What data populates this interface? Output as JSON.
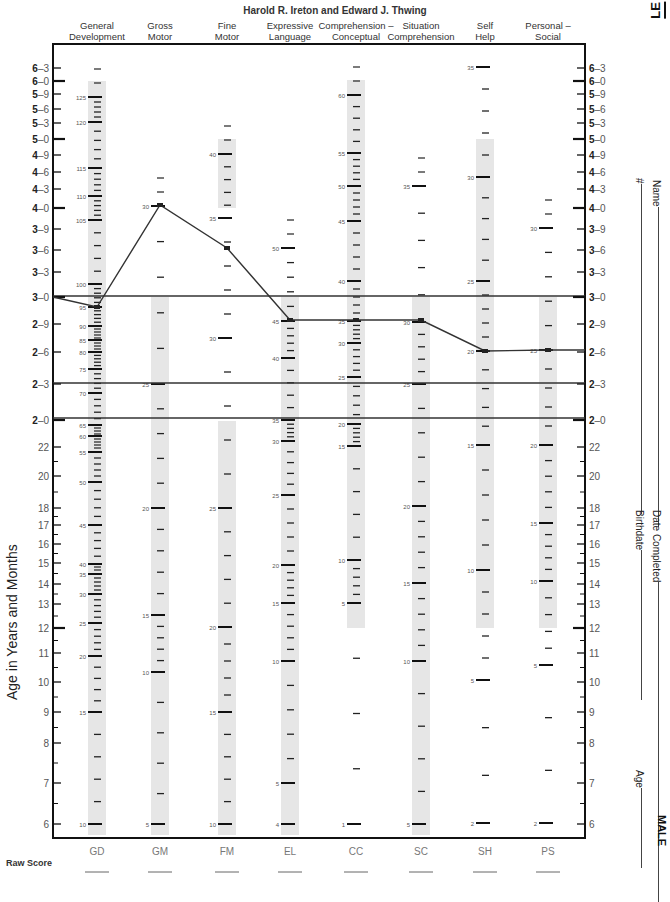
{
  "header": {
    "authors": "Harold R. Ireton and Edward J. Thwing",
    "corner_tag": "LE"
  },
  "columns": [
    {
      "code": "GD",
      "label_line1": "General",
      "label_line2": "Development",
      "x": 97
    },
    {
      "code": "GM",
      "label_line1": "Gross",
      "label_line2": "Motor",
      "x": 160
    },
    {
      "code": "FM",
      "label_line1": "Fine",
      "label_line2": "Motor",
      "x": 227
    },
    {
      "code": "EL",
      "label_line1": "Expressive",
      "label_line2": "Language",
      "x": 290
    },
    {
      "code": "CC",
      "label_line1": "Comprehension –",
      "label_line2": "Conceptual",
      "x": 356
    },
    {
      "code": "SC",
      "label_line1": "Situation",
      "label_line2": "Comprehension",
      "x": 421
    },
    {
      "code": "SH",
      "label_line1": "Self",
      "label_line2": "Help",
      "x": 485
    },
    {
      "code": "PS",
      "label_line1": "Personal –",
      "label_line2": "Social",
      "x": 548
    }
  ],
  "axis": {
    "ylabel": "Age in Years and Months",
    "ticks": [
      {
        "label": "6–3",
        "y": 68,
        "major": false,
        "bold_year": true
      },
      {
        "label": "6–0",
        "y": 81,
        "major": true,
        "bold_year": true
      },
      {
        "label": "5–9",
        "y": 94,
        "major": false,
        "bold_year": true
      },
      {
        "label": "5–6",
        "y": 109,
        "major": false,
        "bold_year": true
      },
      {
        "label": "5–3",
        "y": 123,
        "major": false,
        "bold_year": true
      },
      {
        "label": "5–0",
        "y": 139,
        "major": true,
        "bold_year": true
      },
      {
        "label": "4–9",
        "y": 155,
        "major": false,
        "bold_year": true
      },
      {
        "label": "4–6",
        "y": 172,
        "major": false,
        "bold_year": true
      },
      {
        "label": "4–3",
        "y": 189,
        "major": false,
        "bold_year": true
      },
      {
        "label": "4–0",
        "y": 208,
        "major": true,
        "bold_year": true
      },
      {
        "label": "3–9",
        "y": 229,
        "major": false,
        "bold_year": true
      },
      {
        "label": "3–6",
        "y": 250,
        "major": false,
        "bold_year": true
      },
      {
        "label": "3–3",
        "y": 272,
        "major": false,
        "bold_year": true
      },
      {
        "label": "3–0",
        "y": 297,
        "major": true,
        "bold_year": true
      },
      {
        "label": "2–9",
        "y": 324,
        "major": false,
        "bold_year": true
      },
      {
        "label": "2–6",
        "y": 352,
        "major": false,
        "bold_year": true
      },
      {
        "label": "2–3",
        "y": 384,
        "major": false,
        "bold_year": true
      },
      {
        "label": "2–0",
        "y": 420,
        "major": true,
        "bold_year": true
      },
      {
        "label": "22",
        "y": 447,
        "major": false
      },
      {
        "label": "20",
        "y": 476,
        "major": false
      },
      {
        "label": "18",
        "y": 508,
        "major": false
      },
      {
        "label": "17",
        "y": 525,
        "major": false
      },
      {
        "label": "16",
        "y": 544,
        "major": false
      },
      {
        "label": "15",
        "y": 563,
        "major": false
      },
      {
        "label": "14",
        "y": 584,
        "major": false
      },
      {
        "label": "13",
        "y": 604,
        "major": false
      },
      {
        "label": "12",
        "y": 628,
        "major": true
      },
      {
        "label": "11",
        "y": 653,
        "major": false
      },
      {
        "label": "10",
        "y": 682,
        "major": false
      },
      {
        "label": "9",
        "y": 712,
        "major": false
      },
      {
        "label": "8",
        "y": 743,
        "major": false
      },
      {
        "label": "7",
        "y": 783,
        "major": false
      },
      {
        "label": "6",
        "y": 824,
        "major": false
      }
    ]
  },
  "right_fields": [
    {
      "label": "Name",
      "x": 657,
      "top": 180,
      "len": 320
    },
    {
      "label": "#",
      "x": 640,
      "top": 178,
      "len": 330
    },
    {
      "label": "Date Completed",
      "x": 657,
      "top": 510,
      "len": 320
    },
    {
      "label": "Birthdate",
      "x": 640,
      "top": 510,
      "len": 150
    },
    {
      "label": "Age",
      "x": 640,
      "top": 770,
      "len": 80
    }
  ],
  "gender_label": "MALE",
  "raw_score_label": "Raw Score",
  "chart_data": {
    "type": "line",
    "subtitle": "Harold R. Ireton and Edward J. Thwing",
    "xlabel": "",
    "ylabel": "Age in Years and Months",
    "categories": [
      "GD",
      "GM",
      "FM",
      "EL",
      "CC",
      "SC",
      "SH",
      "PS"
    ],
    "category_labels": [
      "General Development",
      "Gross Motor",
      "Fine Motor",
      "Expressive Language",
      "Comprehension – Conceptual",
      "Situation Comprehension",
      "Self Help",
      "Personal – Social"
    ],
    "series": [
      {
        "name": "Child profile (raw scores)",
        "raw_scores": [
          95,
          30,
          37,
          45,
          35,
          30,
          20,
          25
        ],
        "age_equivalent_months": [
          35,
          48,
          42,
          33,
          33,
          33,
          30,
          30
        ],
        "y_pixels": [
          307,
          205,
          248,
          320,
          320,
          320,
          351,
          350
        ]
      }
    ],
    "reference_lines": [
      {
        "label": "3–0",
        "y": 296
      },
      {
        "label": "2–3",
        "y": 383
      },
      {
        "label": "2–0",
        "y": 418
      }
    ],
    "scales": {
      "GD": {
        "shade": [
          81,
          835
        ],
        "labels": [
          {
            "v": 125,
            "y": 97
          },
          {
            "v": 120,
            "y": 122
          },
          {
            "v": 115,
            "y": 168
          },
          {
            "v": 110,
            "y": 196
          },
          {
            "v": 105,
            "y": 220
          },
          {
            "v": 100,
            "y": 284
          },
          {
            "v": 95,
            "y": 307
          },
          {
            "v": 90,
            "y": 326
          },
          {
            "v": 85,
            "y": 340
          },
          {
            "v": 80,
            "y": 352
          },
          {
            "v": 75,
            "y": 369
          },
          {
            "v": 70,
            "y": 393
          },
          {
            "v": 65,
            "y": 425
          },
          {
            "v": 60,
            "y": 436
          },
          {
            "v": 55,
            "y": 452
          },
          {
            "v": 50,
            "y": 482
          },
          {
            "v": 45,
            "y": 525
          },
          {
            "v": 40,
            "y": 564
          },
          {
            "v": 35,
            "y": 574
          },
          {
            "v": 30,
            "y": 594
          },
          {
            "v": 25,
            "y": 623
          },
          {
            "v": 20,
            "y": 656
          },
          {
            "v": 15,
            "y": 712
          },
          {
            "v": 10,
            "y": 824
          }
        ]
      },
      "GM": {
        "shade": [
          297,
          835
        ],
        "labels": [
          {
            "v": 30,
            "y": 206
          },
          {
            "v": 25,
            "y": 384
          },
          {
            "v": 20,
            "y": 508
          },
          {
            "v": 15,
            "y": 615
          },
          {
            "v": 10,
            "y": 672
          },
          {
            "v": 5,
            "y": 824
          }
        ]
      },
      "FM": {
        "shade": [
          139,
          208
        ],
        "shade2": [
          421,
          835
        ],
        "labels": [
          {
            "v": 40,
            "y": 154
          },
          {
            "v": 35,
            "y": 218
          },
          {
            "v": 30,
            "y": 338
          },
          {
            "v": 25,
            "y": 508
          },
          {
            "v": 20,
            "y": 627
          },
          {
            "v": 15,
            "y": 712
          },
          {
            "v": 10,
            "y": 824
          }
        ]
      },
      "EL": {
        "shade": [
          297,
          835
        ],
        "labels": [
          {
            "v": 50,
            "y": 248
          },
          {
            "v": 45,
            "y": 321
          },
          {
            "v": 40,
            "y": 358
          },
          {
            "v": 35,
            "y": 420
          },
          {
            "v": 30,
            "y": 441
          },
          {
            "v": 25,
            "y": 495
          },
          {
            "v": 20,
            "y": 565
          },
          {
            "v": 15,
            "y": 603
          },
          {
            "v": 10,
            "y": 661
          },
          {
            "v": 5,
            "y": 783
          },
          {
            "v": 4,
            "y": 824
          }
        ]
      },
      "CC": {
        "shade": [
          80,
          628
        ],
        "labels": [
          {
            "v": 60,
            "y": 95
          },
          {
            "v": 55,
            "y": 153
          },
          {
            "v": 50,
            "y": 186
          },
          {
            "v": 45,
            "y": 221
          },
          {
            "v": 40,
            "y": 281
          },
          {
            "v": 35,
            "y": 321
          },
          {
            "v": 30,
            "y": 343
          },
          {
            "v": 25,
            "y": 377
          },
          {
            "v": 20,
            "y": 424
          },
          {
            "v": 15,
            "y": 446
          },
          {
            "v": 10,
            "y": 560
          },
          {
            "v": 5,
            "y": 603
          },
          {
            "v": 1,
            "y": 824
          }
        ]
      },
      "SC": {
        "shade": [
          297,
          835
        ],
        "labels": [
          {
            "v": 35,
            "y": 186
          },
          {
            "v": 30,
            "y": 322
          },
          {
            "v": 25,
            "y": 384
          },
          {
            "v": 20,
            "y": 506
          },
          {
            "v": 15,
            "y": 583
          },
          {
            "v": 10,
            "y": 661
          },
          {
            "v": 5,
            "y": 824
          }
        ]
      },
      "SH": {
        "shade": [
          139,
          628
        ],
        "labels": [
          {
            "v": 35,
            "y": 67
          },
          {
            "v": 30,
            "y": 177
          },
          {
            "v": 25,
            "y": 281
          },
          {
            "v": 20,
            "y": 351
          },
          {
            "v": 15,
            "y": 445
          },
          {
            "v": 10,
            "y": 570
          },
          {
            "v": 5,
            "y": 680
          },
          {
            "v": 2,
            "y": 823
          }
        ]
      },
      "PS": {
        "shade": [
          297,
          628
        ],
        "labels": [
          {
            "v": 30,
            "y": 228
          },
          {
            "v": 25,
            "y": 350
          },
          {
            "v": 20,
            "y": 445
          },
          {
            "v": 15,
            "y": 523
          },
          {
            "v": 10,
            "y": 581
          },
          {
            "v": 5,
            "y": 665
          },
          {
            "v": 2,
            "y": 823
          }
        ]
      }
    }
  }
}
